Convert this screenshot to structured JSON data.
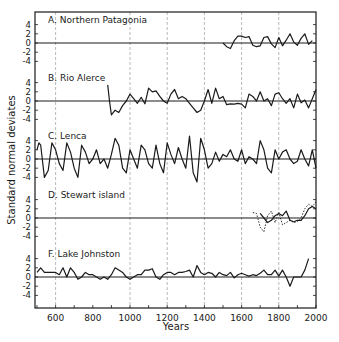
{
  "chart_data": {
    "type": "line",
    "title": "",
    "xlabel": "Years",
    "ylabel": "Standard normal deviates",
    "xlim": [
      500,
      2000
    ],
    "x_ticks": [
      600,
      800,
      1000,
      1200,
      1400,
      1600,
      1800,
      2000
    ],
    "y_ticks": [
      4,
      2,
      0,
      -2,
      -4
    ],
    "grid": "vertical dashed at 600,1000,1200,1400,1600,1800",
    "panels": [
      {
        "label": "A. Northern Patagonia",
        "series": [
          {
            "name": "A",
            "style": "solid",
            "x": [
              1500,
              1520,
              1540,
              1560,
              1580,
              1600,
              1620,
              1640,
              1660,
              1680,
              1700,
              1720,
              1740,
              1760,
              1780,
              1800,
              1820,
              1840,
              1860,
              1880,
              1900,
              1920,
              1940,
              1960,
              1980
            ],
            "y": [
              0,
              -0.8,
              -1.2,
              0.5,
              1.5,
              1.5,
              1.2,
              1.4,
              -0.5,
              -0.8,
              -0.6,
              1.2,
              1.4,
              -0.2,
              -1,
              1.2,
              -0.6,
              0.6,
              2,
              0.2,
              -0.5,
              1,
              2,
              -0.3,
              0.5
            ]
          }
        ]
      },
      {
        "label": "B. Rio Alerce",
        "series": [
          {
            "name": "B",
            "style": "solid",
            "x": [
              880,
              890,
              900,
              920,
              940,
              960,
              980,
              1000,
              1020,
              1040,
              1060,
              1080,
              1100,
              1120,
              1140,
              1160,
              1180,
              1200,
              1220,
              1240,
              1260,
              1280,
              1300,
              1320,
              1340,
              1360,
              1380,
              1400,
              1420,
              1440,
              1460,
              1480,
              1500,
              1520,
              1540,
              1560,
              1580,
              1600,
              1620,
              1640,
              1660,
              1680,
              1700,
              1720,
              1740,
              1760,
              1780,
              1800,
              1820,
              1840,
              1860,
              1880,
              1900,
              1920,
              1940,
              1960,
              1980,
              2000
            ],
            "y": [
              3.5,
              0,
              -3,
              -2,
              -2.5,
              -1,
              0,
              1.5,
              0.5,
              -0.5,
              0.8,
              -0.6,
              2.8,
              2,
              2.2,
              1,
              0,
              -0.5,
              1.5,
              2.5,
              0.5,
              1,
              0.5,
              -0.5,
              -1.5,
              -2.5,
              -2,
              0,
              2.5,
              -0.5,
              2.8,
              0.5,
              1,
              -0.8,
              -0.6,
              -0.7,
              -0.5,
              -0.7,
              -1.5,
              1.5,
              1,
              0,
              2,
              0,
              0.5,
              -1,
              1.5,
              1.8,
              0.5,
              -0.5,
              0.5,
              -1.5,
              1.5,
              -0.4,
              0.2,
              -1.5,
              0.5,
              2.5
            ]
          }
        ]
      },
      {
        "label": "C. Lenca",
        "series": [
          {
            "name": "C",
            "style": "solid",
            "x": [
              500,
              510,
              520,
              540,
              560,
              580,
              600,
              620,
              640,
              660,
              680,
              700,
              720,
              740,
              760,
              780,
              800,
              820,
              840,
              860,
              880,
              900,
              920,
              940,
              960,
              980,
              1000,
              1020,
              1040,
              1060,
              1080,
              1100,
              1120,
              1140,
              1160,
              1180,
              1200,
              1220,
              1240,
              1260,
              1280,
              1300,
              1320,
              1340,
              1360,
              1380,
              1400,
              1420,
              1440,
              1460,
              1480,
              1500,
              1520,
              1540,
              1560,
              1580,
              1600,
              1620,
              1640,
              1660,
              1680,
              1700,
              1720,
              1740,
              1760,
              1780,
              1800,
              1820,
              1840,
              1860,
              1880,
              1900,
              1920,
              1940,
              1960,
              1980,
              2000
            ],
            "y": [
              2,
              3.5,
              3,
              -4,
              -2.5,
              3.5,
              2,
              -1,
              -2.5,
              3.5,
              1.5,
              -2,
              -4,
              3,
              1.5,
              -1,
              0,
              2,
              -1,
              0,
              -2,
              1,
              4.5,
              3,
              -2,
              -3,
              2,
              0,
              -2,
              3,
              2,
              -1,
              -2,
              3,
              -1,
              -3,
              3.5,
              1,
              -1,
              2.5,
              0,
              -2,
              5,
              -3,
              -5,
              4.5,
              2,
              -2,
              -1,
              1.5,
              -0.5,
              1,
              0.5,
              2,
              0,
              -0.5,
              2,
              -1,
              0.5,
              0,
              -1,
              4,
              2,
              -2,
              -3,
              2,
              0,
              1.5,
              2,
              0,
              -1,
              -0.5,
              2,
              0,
              -1.5,
              2,
              -2
            ]
          }
        ]
      },
      {
        "label": "D. Stewart island",
        "series": [
          {
            "name": "D-solid",
            "style": "solid",
            "x": [
              1700,
              1720,
              1740,
              1760,
              1780,
              1800,
              1820,
              1840,
              1860,
              1880,
              1900,
              1920,
              1940,
              1960,
              1980,
              2000
            ],
            "y": [
              1,
              0,
              -1,
              -0.5,
              0.5,
              1,
              0.5,
              1.5,
              -0.5,
              -0.8,
              -0.5,
              -0.5,
              0.5,
              2,
              2.5,
              2
            ]
          },
          {
            "name": "D-dotted",
            "style": "dotted",
            "x": [
              1660,
              1680,
              1700,
              1720,
              1740,
              1760,
              1780,
              1800,
              1820,
              1840,
              1860,
              1880,
              1900,
              1920,
              1940,
              1960,
              1980,
              2000
            ],
            "y": [
              1.2,
              1,
              -2,
              -3,
              0.5,
              1.5,
              -1,
              1.2,
              -1.5,
              -1,
              -0.5,
              -1,
              -0.8,
              0,
              2,
              3,
              2.5,
              3.5
            ]
          }
        ]
      },
      {
        "label": "F. Lake Johnston",
        "series": [
          {
            "name": "F",
            "style": "solid",
            "x": [
              500,
              520,
              540,
              560,
              580,
              600,
              620,
              640,
              660,
              680,
              700,
              720,
              740,
              760,
              780,
              800,
              820,
              840,
              860,
              880,
              900,
              920,
              940,
              960,
              980,
              1000,
              1020,
              1040,
              1060,
              1080,
              1100,
              1120,
              1140,
              1160,
              1180,
              1200,
              1220,
              1240,
              1260,
              1280,
              1300,
              1320,
              1340,
              1360,
              1380,
              1400,
              1420,
              1440,
              1460,
              1480,
              1500,
              1520,
              1540,
              1560,
              1580,
              1600,
              1620,
              1640,
              1660,
              1680,
              1700,
              1720,
              1740,
              1760,
              1780,
              1800,
              1820,
              1840,
              1860,
              1880,
              1900,
              1920,
              1940,
              1960,
              1980,
              2000
            ],
            "y": [
              1,
              2,
              1,
              1,
              1,
              1,
              0.5,
              2,
              0,
              2,
              1,
              -0.5,
              0,
              1,
              0.5,
              0.5,
              0,
              -0.5,
              0,
              -0.5,
              0.5,
              2,
              1.5,
              1,
              0,
              -0.5,
              0,
              0.5,
              0.5,
              1.5,
              1.5,
              1.8,
              0,
              -0.5,
              0.5,
              1,
              1,
              0.5,
              1,
              1,
              1.2,
              1.5,
              0,
              2.5,
              1,
              0.5,
              1,
              0.8,
              0,
              1,
              0.5,
              0.3,
              1,
              -0.2,
              0.5,
              0.8,
              0.5,
              0.2,
              0.5,
              0.3,
              0.8,
              1.5,
              0.5,
              0.5,
              1.5,
              0.2,
              1.5,
              0,
              -2,
              0,
              0,
              0,
              1.5,
              4
            ]
          }
        ]
      }
    ]
  }
}
